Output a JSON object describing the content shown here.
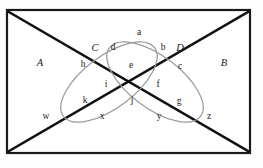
{
  "diagram": {
    "colors": {
      "frame_stroke": "#1a1a1a",
      "diagonal_stroke": "#111111",
      "ellipse_stroke": "#9a9a9a",
      "background": "#ffffff",
      "label_color": "#1b1b1b"
    },
    "sets": [
      {
        "key": "A",
        "label": "A",
        "style": "italic"
      },
      {
        "key": "B",
        "label": "B",
        "style": "italic"
      },
      {
        "key": "C",
        "label": "C",
        "style": "italic"
      },
      {
        "key": "D",
        "label": "D",
        "style": "italic"
      }
    ],
    "region_labels": [
      {
        "key": "a",
        "label": "a",
        "x": 139,
        "y": 33
      },
      {
        "key": "d",
        "label": "d",
        "x": 113,
        "y": 48
      },
      {
        "key": "b",
        "label": "b",
        "x": 163,
        "y": 48
      },
      {
        "key": "h",
        "label": "h",
        "x": 83,
        "y": 65
      },
      {
        "key": "e",
        "label": "e",
        "x": 131,
        "y": 66
      },
      {
        "key": "c",
        "label": "c",
        "x": 180,
        "y": 67
      },
      {
        "key": "i",
        "label": "i",
        "x": 106,
        "y": 85
      },
      {
        "key": "f",
        "label": "f",
        "x": 158,
        "y": 85
      },
      {
        "key": "k",
        "label": "k",
        "x": 85,
        "y": 101
      },
      {
        "key": "j",
        "label": "j",
        "x": 132,
        "y": 101
      },
      {
        "key": "g",
        "label": "g",
        "x": 179,
        "y": 102
      },
      {
        "key": "w",
        "label": "w",
        "x": 46,
        "y": 117
      },
      {
        "key": "x",
        "label": "x",
        "x": 102,
        "y": 117
      },
      {
        "key": "y",
        "label": "y",
        "x": 159,
        "y": 117
      },
      {
        "key": "z",
        "label": "z",
        "x": 209,
        "y": 117
      }
    ],
    "set_label_positions": [
      {
        "key": "A",
        "x": 40,
        "y": 63
      },
      {
        "key": "B",
        "x": 224,
        "y": 63
      },
      {
        "key": "C",
        "x": 95,
        "y": 48
      },
      {
        "key": "D",
        "x": 180,
        "y": 48
      }
    ],
    "geometry": {
      "frame": {
        "x": 7,
        "y": 10,
        "width": 243,
        "height": 143
      },
      "diagonal_1": {
        "x1": 9,
        "y1": 12,
        "x2": 248,
        "y2": 151
      },
      "diagonal_2": {
        "x1": 9,
        "y1": 151,
        "x2": 248,
        "y2": 12
      },
      "ellipse_left": {
        "cx": 109,
        "cy": 82,
        "rx": 57,
        "ry": 26,
        "rotation": -37
      },
      "ellipse_right": {
        "cx": 155,
        "cy": 82,
        "rx": 57,
        "ry": 26,
        "rotation": 37
      }
    }
  }
}
